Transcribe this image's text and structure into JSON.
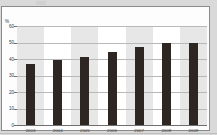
{
  "chart_data": {
    "type": "bar",
    "title": "",
    "subtitle": "",
    "xlabel": "",
    "ylabel": "%",
    "unit_label": "%",
    "categories": [
      "2003",
      "2004",
      "2005",
      "2006",
      "2007",
      "2008",
      "2009"
    ],
    "values": [
      37,
      39.5,
      41,
      44.5,
      47,
      50,
      50
    ],
    "series": [
      {
        "name": "",
        "values": [
          37,
          39.5,
          41,
          44.5,
          47,
          50,
          50
        ]
      }
    ],
    "ylim": [
      0,
      60
    ],
    "yticks": [
      0,
      10,
      20,
      30,
      40,
      50,
      60
    ],
    "ytick_labels": [
      "0",
      "10",
      "20",
      "30",
      "40",
      "50",
      "60"
    ],
    "grid": true,
    "grid_axis": "y",
    "legend": false,
    "legend_position": "none",
    "alternating_category_bands": true,
    "bar_color": "#2e2622",
    "band_color": "#e7e7e7",
    "gridline_color": "#b9b9b9",
    "axis_color": "#6f6f6f",
    "plot_background": "#ffffff",
    "panel_background": "#fdfdfd",
    "page_background": "#d9d9d9",
    "panel_border_color": "#8a8a8a"
  }
}
